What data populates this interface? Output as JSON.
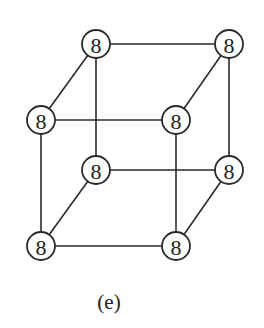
{
  "figure": {
    "caption": "(e)"
  },
  "nodes": [
    {
      "id": "top-back-left",
      "label": "8",
      "x": 96,
      "y": 44
    },
    {
      "id": "top-back-right",
      "label": "8",
      "x": 229,
      "y": 44
    },
    {
      "id": "top-front-left",
      "label": "8",
      "x": 41,
      "y": 120
    },
    {
      "id": "top-front-right",
      "label": "8",
      "x": 176,
      "y": 120
    },
    {
      "id": "bottom-back-left",
      "label": "8",
      "x": 96,
      "y": 170
    },
    {
      "id": "bottom-back-right",
      "label": "8",
      "x": 229,
      "y": 170
    },
    {
      "id": "bottom-front-left",
      "label": "8",
      "x": 41,
      "y": 246
    },
    {
      "id": "bottom-front-right",
      "label": "8",
      "x": 176,
      "y": 246
    }
  ],
  "edges": [
    [
      "top-back-left",
      "top-back-right"
    ],
    [
      "top-front-left",
      "top-front-right"
    ],
    [
      "bottom-back-left",
      "bottom-back-right"
    ],
    [
      "bottom-front-left",
      "bottom-front-right"
    ],
    [
      "top-back-left",
      "top-front-left"
    ],
    [
      "top-back-right",
      "top-front-right"
    ],
    [
      "bottom-back-left",
      "bottom-front-left"
    ],
    [
      "bottom-back-right",
      "bottom-front-right"
    ],
    [
      "top-back-left",
      "bottom-back-left"
    ],
    [
      "top-back-right",
      "bottom-back-right"
    ],
    [
      "top-front-left",
      "bottom-front-left"
    ],
    [
      "top-front-right",
      "bottom-front-right"
    ]
  ],
  "style": {
    "node_radius": 14,
    "stroke_color": "#2a2a2a"
  }
}
